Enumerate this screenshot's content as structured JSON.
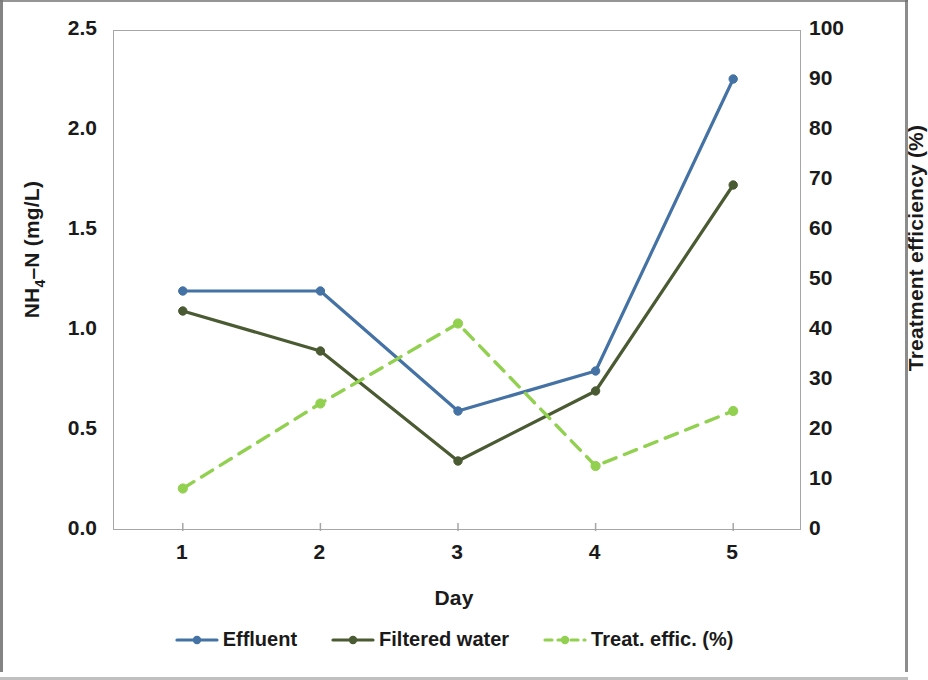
{
  "chart_data": {
    "type": "line",
    "title": "",
    "xlabel": "Day",
    "ylabel": "NH4-N (mg/L)",
    "y2label": "Treatment efficiency (%)",
    "categories": [
      "1",
      "2",
      "3",
      "4",
      "5"
    ],
    "ylim": [
      0,
      2.5
    ],
    "y2lim": [
      0,
      100
    ],
    "yticks": [
      "0.0",
      "0.5",
      "1.0",
      "1.5",
      "2.0",
      "2.5"
    ],
    "y2ticks": [
      "0",
      "10",
      "20",
      "30",
      "40",
      "50",
      "60",
      "70",
      "80",
      "90",
      "100"
    ],
    "grid": false,
    "legend_position": "bottom",
    "series": [
      {
        "name": "Effluent",
        "axis": "left",
        "color": "#4472a4",
        "style": "solid",
        "marker": "circle",
        "values": [
          1.2,
          1.2,
          0.6,
          0.8,
          2.26
        ]
      },
      {
        "name": "Filtered water",
        "axis": "left",
        "color": "#4a5a32",
        "style": "solid",
        "marker": "circle",
        "values": [
          1.1,
          0.9,
          0.35,
          0.7,
          1.73
        ]
      },
      {
        "name": "Treat. effic. (%)",
        "axis": "right",
        "color": "#92d050",
        "style": "dashed",
        "marker": "circle",
        "values": [
          8.5,
          25.5,
          41.5,
          13.0,
          24.0
        ]
      }
    ]
  },
  "axes": {
    "left_title_html": "NH<sub>4</sub>&#8211;N (mg/L)",
    "right_title": "Treatment efficiency (%)",
    "x_title": "Day"
  },
  "legend": {
    "items": [
      {
        "label": "Effluent",
        "color": "#4472a4",
        "style": "solid"
      },
      {
        "label": "Filtered water",
        "color": "#4a5a32",
        "style": "solid"
      },
      {
        "label": "Treat. effic. (%)",
        "color": "#92d050",
        "style": "dashed"
      }
    ]
  },
  "colors": {
    "effluent": "#4472a4",
    "filtered_water": "#4a5a32",
    "treatment_efficiency": "#92d050",
    "axis": "#a6a6a6",
    "text": "#1a1a1a"
  }
}
